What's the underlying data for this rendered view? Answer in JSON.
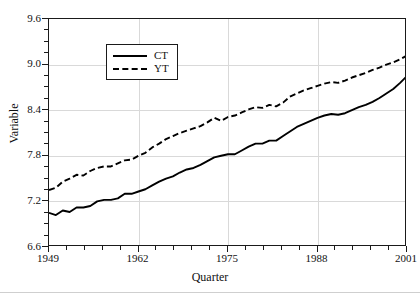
{
  "chart_data": {
    "type": "line",
    "title": "",
    "xlabel": "Quarter",
    "ylabel": "Variable",
    "xlim": [
      1949,
      2001
    ],
    "ylim": [
      6.6,
      9.6
    ],
    "xticks": [
      1949,
      1962,
      1975,
      1988,
      2001
    ],
    "yticks": [
      6.6,
      7.2,
      7.8,
      8.4,
      9.0,
      9.6
    ],
    "ytick_labels": [
      "6.6",
      "7.2",
      "7.8",
      "8.4",
      "9.0",
      "9.6"
    ],
    "xtick_labels": [
      "1949",
      "1962",
      "1975",
      "1988",
      "2001"
    ],
    "y_minor_interval": 0.15,
    "x_minor_interval": 2.6,
    "grid": "major gridlines light gray, horizontal and vertical",
    "legend": {
      "position": "top-left inside plot",
      "entries": [
        {
          "name": "CT",
          "style": "solid",
          "color": "#000000"
        },
        {
          "name": "YT",
          "style": "dashed",
          "color": "#000000"
        }
      ]
    },
    "series": [
      {
        "name": "CT",
        "style": "solid",
        "color": "#000000",
        "x": [
          1949,
          1950,
          1951,
          1952,
          1953,
          1954,
          1955,
          1956,
          1957,
          1958,
          1959,
          1960,
          1961,
          1962,
          1963,
          1964,
          1965,
          1966,
          1967,
          1968,
          1969,
          1970,
          1971,
          1972,
          1973,
          1974,
          1975,
          1976,
          1977,
          1978,
          1979,
          1980,
          1981,
          1982,
          1983,
          1984,
          1985,
          1986,
          1987,
          1988,
          1989,
          1990,
          1991,
          1992,
          1993,
          1994,
          1995,
          1996,
          1997,
          1998,
          1999,
          2000,
          2001
        ],
        "values": [
          7.05,
          7.02,
          7.08,
          7.06,
          7.12,
          7.12,
          7.14,
          7.2,
          7.22,
          7.22,
          7.24,
          7.3,
          7.3,
          7.33,
          7.36,
          7.41,
          7.46,
          7.5,
          7.53,
          7.58,
          7.62,
          7.64,
          7.68,
          7.73,
          7.78,
          7.8,
          7.82,
          7.82,
          7.87,
          7.92,
          7.96,
          7.96,
          8.0,
          8.0,
          8.06,
          8.12,
          8.18,
          8.22,
          8.26,
          8.3,
          8.33,
          8.35,
          8.34,
          8.36,
          8.4,
          8.44,
          8.47,
          8.51,
          8.56,
          8.62,
          8.68,
          8.76,
          8.85
        ]
      },
      {
        "name": "YT",
        "style": "dashed",
        "color": "#000000",
        "x": [
          1949,
          1950,
          1951,
          1952,
          1953,
          1954,
          1955,
          1956,
          1957,
          1958,
          1959,
          1960,
          1961,
          1962,
          1963,
          1964,
          1965,
          1966,
          1967,
          1968,
          1969,
          1970,
          1971,
          1972,
          1973,
          1974,
          1975,
          1976,
          1977,
          1978,
          1979,
          1980,
          1981,
          1982,
          1983,
          1984,
          1985,
          1986,
          1987,
          1988,
          1989,
          1990,
          1991,
          1992,
          1993,
          1994,
          1995,
          1996,
          1997,
          1998,
          1999,
          2000,
          2001
        ],
        "values": [
          7.35,
          7.38,
          7.46,
          7.5,
          7.55,
          7.54,
          7.6,
          7.64,
          7.66,
          7.66,
          7.7,
          7.74,
          7.75,
          7.8,
          7.84,
          7.91,
          7.96,
          8.02,
          8.06,
          8.1,
          8.13,
          8.16,
          8.19,
          8.24,
          8.3,
          8.26,
          8.31,
          8.33,
          8.37,
          8.41,
          8.44,
          8.43,
          8.47,
          8.45,
          8.5,
          8.58,
          8.62,
          8.66,
          8.69,
          8.72,
          8.75,
          8.77,
          8.76,
          8.79,
          8.83,
          8.86,
          8.89,
          8.93,
          8.96,
          9.0,
          9.03,
          9.07,
          9.12
        ]
      }
    ]
  },
  "axes": {
    "y_title": "Variable",
    "x_title": "Quarter"
  }
}
